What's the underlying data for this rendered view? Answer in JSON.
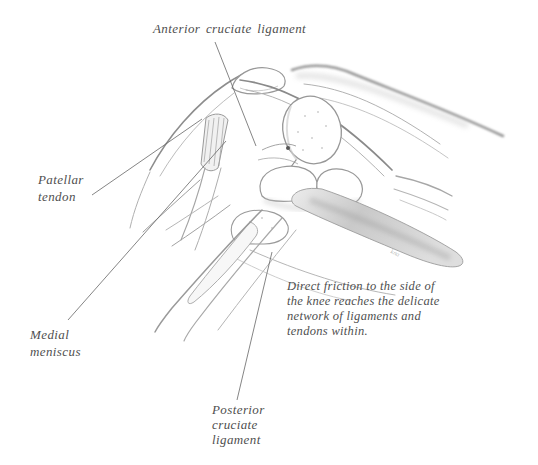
{
  "page": {
    "type": "book-illustration",
    "colors": {
      "background": "#ffffff",
      "text": "#4f4f4f",
      "sketch_stroke": "#8f8f8f",
      "leader_line": "#666666"
    }
  },
  "labels": {
    "acl": "Anterior cruciate ligament",
    "patellar_tendon": "Patellar\ntendon",
    "medial_meniscus": "Medial\nmeniscus",
    "posterior_cruciate_ligament": "Posterior\ncruciate\nligament"
  },
  "caption": {
    "text": "Direct friction to the side of\nthe knee reaches the delicate\nnetwork of ligaments and\ntendons within."
  },
  "illustration": {
    "signature": "kna"
  }
}
